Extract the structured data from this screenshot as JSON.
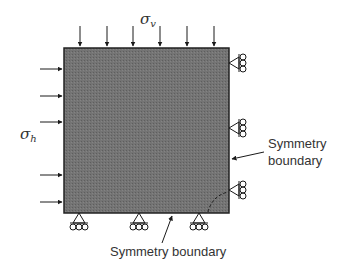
{
  "labels": {
    "sigma_v": "σ",
    "sigma_v_sub": "v",
    "sigma_h": "σ",
    "sigma_h_sub": "h",
    "symmetry_right_line1": "Symmetry",
    "symmetry_right_line2": "boundary",
    "symmetry_bottom": "Symmetry boundary"
  },
  "colors": {
    "block_fill": "#6f6f6f",
    "stroke": "#1a1a1a",
    "text": "#333333"
  },
  "geometry": {
    "block": {
      "x": 64,
      "y": 48,
      "w": 165,
      "h": 165
    },
    "top_arrow_x": [
      80,
      107,
      133,
      160,
      187,
      214
    ],
    "left_arrow_y": [
      69,
      96,
      122,
      148,
      175,
      202
    ],
    "right_support_y": [
      63,
      128,
      190
    ],
    "bottom_support_x": [
      79,
      139,
      199
    ]
  }
}
